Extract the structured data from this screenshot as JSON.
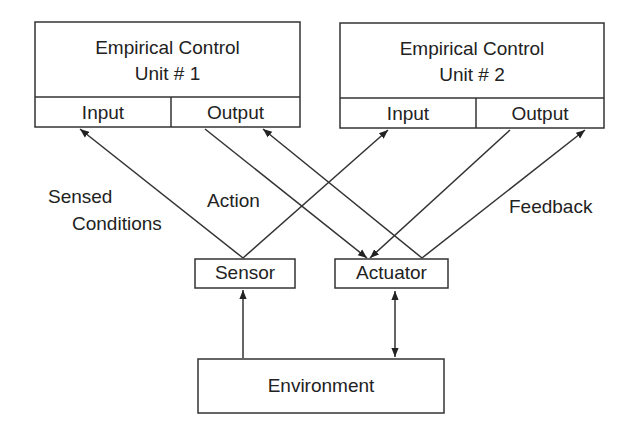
{
  "diagram": {
    "units": [
      {
        "title_line1": "Empirical Control",
        "title_line2": "Unit # 1",
        "input": "Input",
        "output": "Output"
      },
      {
        "title_line1": "Empirical Control",
        "title_line2": "Unit # 2",
        "input": "Input",
        "output": "Output"
      }
    ],
    "sensor": "Sensor",
    "actuator": "Actuator",
    "environment": "Environment",
    "edge_labels": {
      "sensed_line1": "Sensed",
      "sensed_line2": "Conditions",
      "action": "Action",
      "feedback": "Feedback"
    }
  }
}
